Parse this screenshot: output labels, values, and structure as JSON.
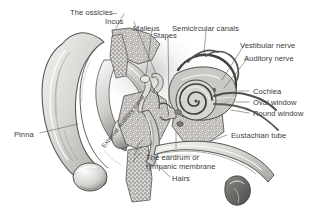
{
  "figure": {
    "background_color": "#ffffff",
    "ink_color": "#3a3a3c",
    "style": "grayscale pen-and-ink anatomical illustration, cutaway cross-section"
  },
  "labels": {
    "ossicles": "The ossicles–",
    "incus": "Incus",
    "malleus": "Malleus",
    "stapes": "Stapes",
    "semicircular_canals": "Semicircular canals",
    "vestibular_nerve": "Vestibular nerve",
    "auditory_nerve": "Auditory nerve",
    "cochlea": "Cochlea",
    "oval_window": "Oval window",
    "round_window": "Round window",
    "eustachian_tube": "Eustachian tube",
    "eardrum": "The eardrum or tympanic membrane",
    "hairs": "Hairs",
    "pinna": "Pinna",
    "external_auditory_canal": "External auditory canal"
  },
  "structures": [
    {
      "name": "pinna",
      "region": "outer ear",
      "label": "Pinna"
    },
    {
      "name": "external-auditory-canal",
      "region": "outer ear",
      "label": "External auditory canal"
    },
    {
      "name": "hairs",
      "region": "outer ear",
      "label": "Hairs"
    },
    {
      "name": "tympanic-membrane",
      "region": "middle ear",
      "label": "The eardrum or tympanic membrane"
    },
    {
      "name": "malleus",
      "region": "middle ear",
      "label": "Malleus"
    },
    {
      "name": "incus",
      "region": "middle ear",
      "label": "Incus"
    },
    {
      "name": "stapes",
      "region": "middle ear",
      "label": "Stapes"
    },
    {
      "name": "eustachian-tube",
      "region": "middle ear",
      "label": "Eustachian tube"
    },
    {
      "name": "oval-window",
      "region": "middle ear",
      "label": "Oval window"
    },
    {
      "name": "round-window",
      "region": "middle ear",
      "label": "Round window"
    },
    {
      "name": "semicircular-canals",
      "region": "inner ear",
      "label": "Semicircular canals"
    },
    {
      "name": "cochlea",
      "region": "inner ear",
      "label": "Cochlea"
    },
    {
      "name": "vestibular-nerve",
      "region": "inner ear",
      "label": "Vestibular nerve"
    },
    {
      "name": "auditory-nerve",
      "region": "inner ear",
      "label": "Auditory nerve"
    }
  ]
}
